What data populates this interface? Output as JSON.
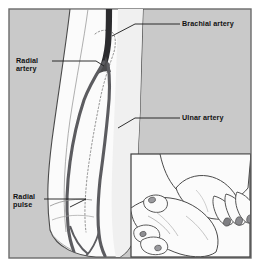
{
  "figure": {
    "frame_color": "#6b6b6b",
    "background_color": "#c9c9c9",
    "skin_fill": "#fbfbfb",
    "artery_color": "#5c5c60",
    "brachial_color": "#2b2b2e",
    "outline_color": "#4a4a4a",
    "label_color": "#111111"
  },
  "labels": {
    "brachial": "Brachial artery",
    "radial_artery_line1": "Radial",
    "radial_artery_line2": "artery",
    "ulnar": "Ulnar artery",
    "radial_pulse_line1": "Radial",
    "radial_pulse_line2": "pulse"
  },
  "inset": {
    "caption": "Hand palpating radial pulse at the wrist",
    "border_color": "#3c3c3c",
    "fill": "#fbfbfb"
  },
  "structures": [
    {
      "name": "brachial-artery",
      "label": "Brachial artery"
    },
    {
      "name": "radial-artery",
      "label": "Radial artery"
    },
    {
      "name": "ulnar-artery",
      "label": "Ulnar artery"
    },
    {
      "name": "radial-pulse-site",
      "label": "Radial pulse"
    }
  ]
}
